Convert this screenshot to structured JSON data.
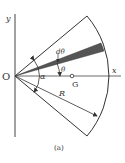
{
  "figure": {
    "caption": "(a)",
    "labels": {
      "origin": "O",
      "x_axis": "x",
      "y_axis": "y",
      "d_theta": "dθ",
      "theta": "θ",
      "alpha": "α",
      "centroid": "G",
      "radius": "R"
    },
    "colors": {
      "line": "#333333",
      "shaded_strip": "#555555",
      "background": "#ffffff"
    }
  }
}
